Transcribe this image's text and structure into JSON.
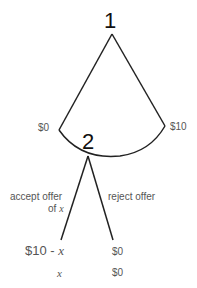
{
  "diagram": {
    "type": "game-tree",
    "nodes": [
      {
        "id": "1",
        "label": "1"
      },
      {
        "id": "2",
        "label": "2"
      }
    ],
    "node1_range": {
      "left_label": "$0",
      "right_label": "$10"
    },
    "node2_branches": [
      {
        "label_line1": "accept offer",
        "label_line2_prefix": "of ",
        "label_line2_var": "x",
        "payoff_player1_prefix": "$10 - ",
        "payoff_player1_var": "x",
        "payoff_player2": "x"
      },
      {
        "label": "reject offer",
        "payoff_player1": "$0",
        "payoff_player2": "$0"
      }
    ]
  },
  "colors": {
    "line": "#222222",
    "text": "#555555",
    "node": "#111111"
  }
}
